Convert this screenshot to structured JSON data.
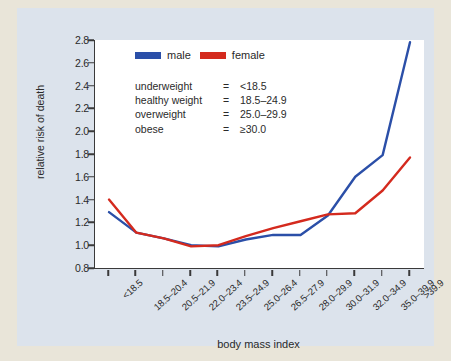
{
  "colors": {
    "male": "#2b4fa8",
    "female": "#d42a1e",
    "axis": "#3a3a3a",
    "panel_background": "#dce3ec",
    "plot_background": "#ffffff",
    "outer_background": "#e9e5d9",
    "text": "#2a2a2a"
  },
  "legend": {
    "entries": [
      {
        "label": "male",
        "color": "#2b4fa8"
      },
      {
        "label": "female",
        "color": "#d42a1e"
      }
    ]
  },
  "definitions": {
    "rows": [
      {
        "term": "underweight",
        "eq": "=",
        "value": "<18.5"
      },
      {
        "term": "healthy weight",
        "eq": "=",
        "value": "18.5–24.9"
      },
      {
        "term": "overweight",
        "eq": "=",
        "value": "25.0–29.9"
      },
      {
        "term": "obese",
        "eq": "=",
        "value": "≥30.0"
      }
    ]
  },
  "chart_data": {
    "type": "line",
    "title": "",
    "xlabel": "body mass index",
    "ylabel": "relative risk of death",
    "categories": [
      "<18.5",
      "18.5–20.4",
      "20.5–21.9",
      "22.0–23.4",
      "23.5–24.9",
      "25.0–26.4",
      "26.5–27.9",
      "28.0–29.9",
      "30.0–31.9",
      "32.0–34.9",
      "35.0–39.9",
      ">39.9"
    ],
    "series": [
      {
        "name": "male",
        "color": "#2b4fa8",
        "values": [
          1.29,
          1.11,
          1.06,
          1.0,
          0.99,
          1.05,
          1.09,
          1.09,
          1.26,
          1.6,
          1.79,
          2.78
        ]
      },
      {
        "name": "female",
        "color": "#d42a1e",
        "values": [
          1.4,
          1.11,
          1.06,
          0.99,
          1.0,
          1.08,
          1.15,
          1.21,
          1.27,
          1.28,
          1.48,
          1.77
        ]
      }
    ],
    "ylim": [
      0.8,
      2.8
    ],
    "yticks": [
      "0.8",
      "1.0",
      "1.2",
      "1.4",
      "1.6",
      "1.8",
      "2.0",
      "2.2",
      "2.4",
      "2.6",
      "2.8"
    ],
    "ytick_values": [
      0.8,
      1.0,
      1.2,
      1.4,
      1.6,
      1.8,
      2.0,
      2.2,
      2.4,
      2.6,
      2.8
    ],
    "grid": false,
    "legend_position": "top-left"
  }
}
